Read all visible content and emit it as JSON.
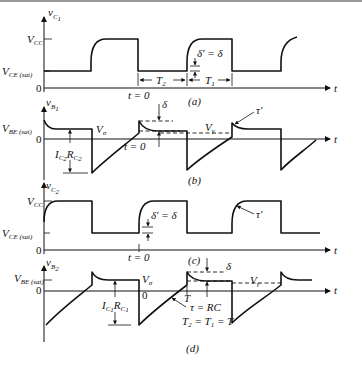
{
  "figure": {
    "panels": [
      {
        "id": "a",
        "caption": "(a)",
        "y_axis_label": "v",
        "y_axis_sub": "C",
        "y_axis_subsub": "1",
        "levels": {
          "high": "V",
          "high_sub": "CC",
          "low": "V",
          "low_sub": "CE (sat)",
          "zero": "0"
        },
        "annotations": {
          "t0": "t = 0",
          "T2": "T",
          "T2_sub": "2",
          "T1": "T",
          "T1_sub": "1",
          "delta": "δ' = δ"
        },
        "x_axis_label": "t"
      },
      {
        "id": "b",
        "caption": "(b)",
        "y_axis_label": "v",
        "y_axis_sub": "B",
        "y_axis_subsub": "1",
        "levels": {
          "high": "V",
          "high_sub": "BE (sat)",
          "zero": "0"
        },
        "annotations": {
          "v0": "V",
          "v0_sub": "σ",
          "icrc": "I",
          "icrc_sub1": "C",
          "icrc_subsub1": "2",
          "icrc_r": "R",
          "icrc_sub2": "C",
          "icrc_subsub2": "2",
          "t0": "t = 0",
          "delta": "δ",
          "vgamma": "V",
          "vgamma_sub": "γ",
          "tau_prime": "τ'"
        },
        "x_axis_label": "t"
      },
      {
        "id": "c",
        "caption": "(c)",
        "y_axis_label": "v",
        "y_axis_sub": "C",
        "y_axis_subsub": "2",
        "levels": {
          "high": "V",
          "high_sub": "CC",
          "low": "V",
          "low_sub": "CE (sat)",
          "zero": "0"
        },
        "annotations": {
          "t0": "t = 0",
          "delta": "δ' = δ",
          "tau_prime": "τ'"
        },
        "x_axis_label": "t"
      },
      {
        "id": "d",
        "caption": "(d)",
        "y_axis_label": "v",
        "y_axis_sub": "B",
        "y_axis_subsub": "2",
        "levels": {
          "high": "V",
          "high_sub": "BE (sat)",
          "zero": "0"
        },
        "annotations": {
          "v0": "V",
          "v0_sub": "σ",
          "zero_mark": "0",
          "icrc": "I",
          "icrc_sub1": "C",
          "icrc_subsub1": "1",
          "icrc_r": "R",
          "icrc_sub2": "C",
          "icrc_subsub2": "1",
          "T": "T",
          "tau": "τ = RC",
          "period_eq": "T",
          "period_eq_sub2": "2",
          "period_eq_mid": " = T",
          "period_eq_sub1": "1",
          "period_eq_end": " = T",
          "delta": "δ",
          "vgamma": "V",
          "vgamma_sub": "γ"
        },
        "x_axis_label": "t"
      }
    ]
  }
}
